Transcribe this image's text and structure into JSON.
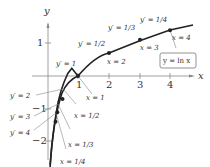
{
  "axes": {
    "x_label": "x",
    "y_label": "y",
    "x_ticks": [
      "1",
      "2",
      "3",
      "4"
    ],
    "y_ticks": [
      "1",
      "−1",
      "−2"
    ]
  },
  "curve_label": "y = ln x",
  "points": [
    {
      "x_label": "x = 1/4",
      "slope_label": "y′ = 4"
    },
    {
      "x_label": "x = 1/3",
      "slope_label": "y′ = 3"
    },
    {
      "x_label": "x = 1/2",
      "slope_label": "y′ = 2"
    },
    {
      "x_label": "x = 1",
      "slope_label": "y′ = 1"
    },
    {
      "x_label": "x = 2",
      "slope_label": "y′ = 1/2"
    },
    {
      "x_label": "x = 3",
      "slope_label": "y′ = 1/3"
    },
    {
      "x_label": "x = 4",
      "slope_label": "y′ = 1/4"
    }
  ],
  "colors": {
    "curve": "#222222",
    "axis": "#777777",
    "text": "#333333"
  }
}
